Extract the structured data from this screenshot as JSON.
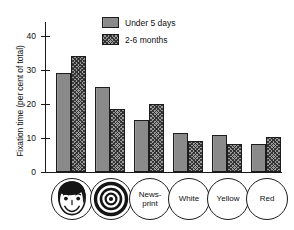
{
  "chart_data": {
    "type": "bar",
    "title": "",
    "xlabel": "",
    "ylabel": "Fixation time (per cent of total)",
    "ylim": [
      0,
      44
    ],
    "yticks": [
      0,
      10,
      20,
      30,
      40
    ],
    "ytick_labels": [
      "0",
      "10",
      "20",
      "30",
      "40"
    ],
    "grid": false,
    "legend_position": "top-center",
    "categories": [
      "Face",
      "Bullseye",
      "News-print",
      "White",
      "Yellow",
      "Red"
    ],
    "category_labels": [
      "",
      "",
      "News-\nprint",
      "White",
      "Yellow",
      "Red"
    ],
    "category_icons": [
      "smiling-face-icon",
      "bullseye-icon",
      "",
      "",
      "",
      ""
    ],
    "series": [
      {
        "name": "Under 5 days",
        "values": [
          29,
          25,
          15.2,
          11.5,
          11,
          8.2
        ]
      },
      {
        "name": "2-6 months",
        "values": [
          34,
          18.5,
          20,
          9,
          8.2,
          10.2
        ]
      }
    ]
  },
  "legend": {
    "items": [
      {
        "label": "Under 5 days",
        "pattern": "solid-gray"
      },
      {
        "label": "2-6 months",
        "pattern": "checkered-gray"
      }
    ]
  },
  "colors": {
    "bar_solid": "#8a8a8a",
    "bar_hatch": "#9a9a9a",
    "axis": "#1a1a1a",
    "text": "#111111",
    "background": "#ffffff"
  }
}
